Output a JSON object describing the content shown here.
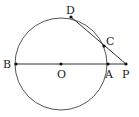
{
  "diagram": {
    "type": "geometry",
    "circle": {
      "center": "O",
      "cx": 61,
      "cy": 64,
      "r": 46,
      "stroke": "#555555"
    },
    "points": [
      {
        "name": "B",
        "label": "B",
        "x": 16,
        "y": 64,
        "lx": 3,
        "ly": 68
      },
      {
        "name": "O",
        "label": "O",
        "x": 61,
        "y": 64,
        "lx": 57,
        "ly": 77
      },
      {
        "name": "A",
        "label": "A",
        "x": 108,
        "y": 64,
        "lx": 106,
        "ly": 78
      },
      {
        "name": "P",
        "label": "P",
        "x": 126,
        "y": 64,
        "lx": 122,
        "ly": 78
      },
      {
        "name": "D",
        "label": "D",
        "x": 71,
        "y": 17,
        "lx": 67,
        "ly": 14
      },
      {
        "name": "C",
        "label": "C",
        "x": 104,
        "y": 46,
        "lx": 106,
        "ly": 44
      }
    ],
    "segments": [
      {
        "from": "B",
        "to": "P"
      },
      {
        "from": "D",
        "to": "P"
      }
    ],
    "line_color": "#333333",
    "point_color": "#111111"
  }
}
